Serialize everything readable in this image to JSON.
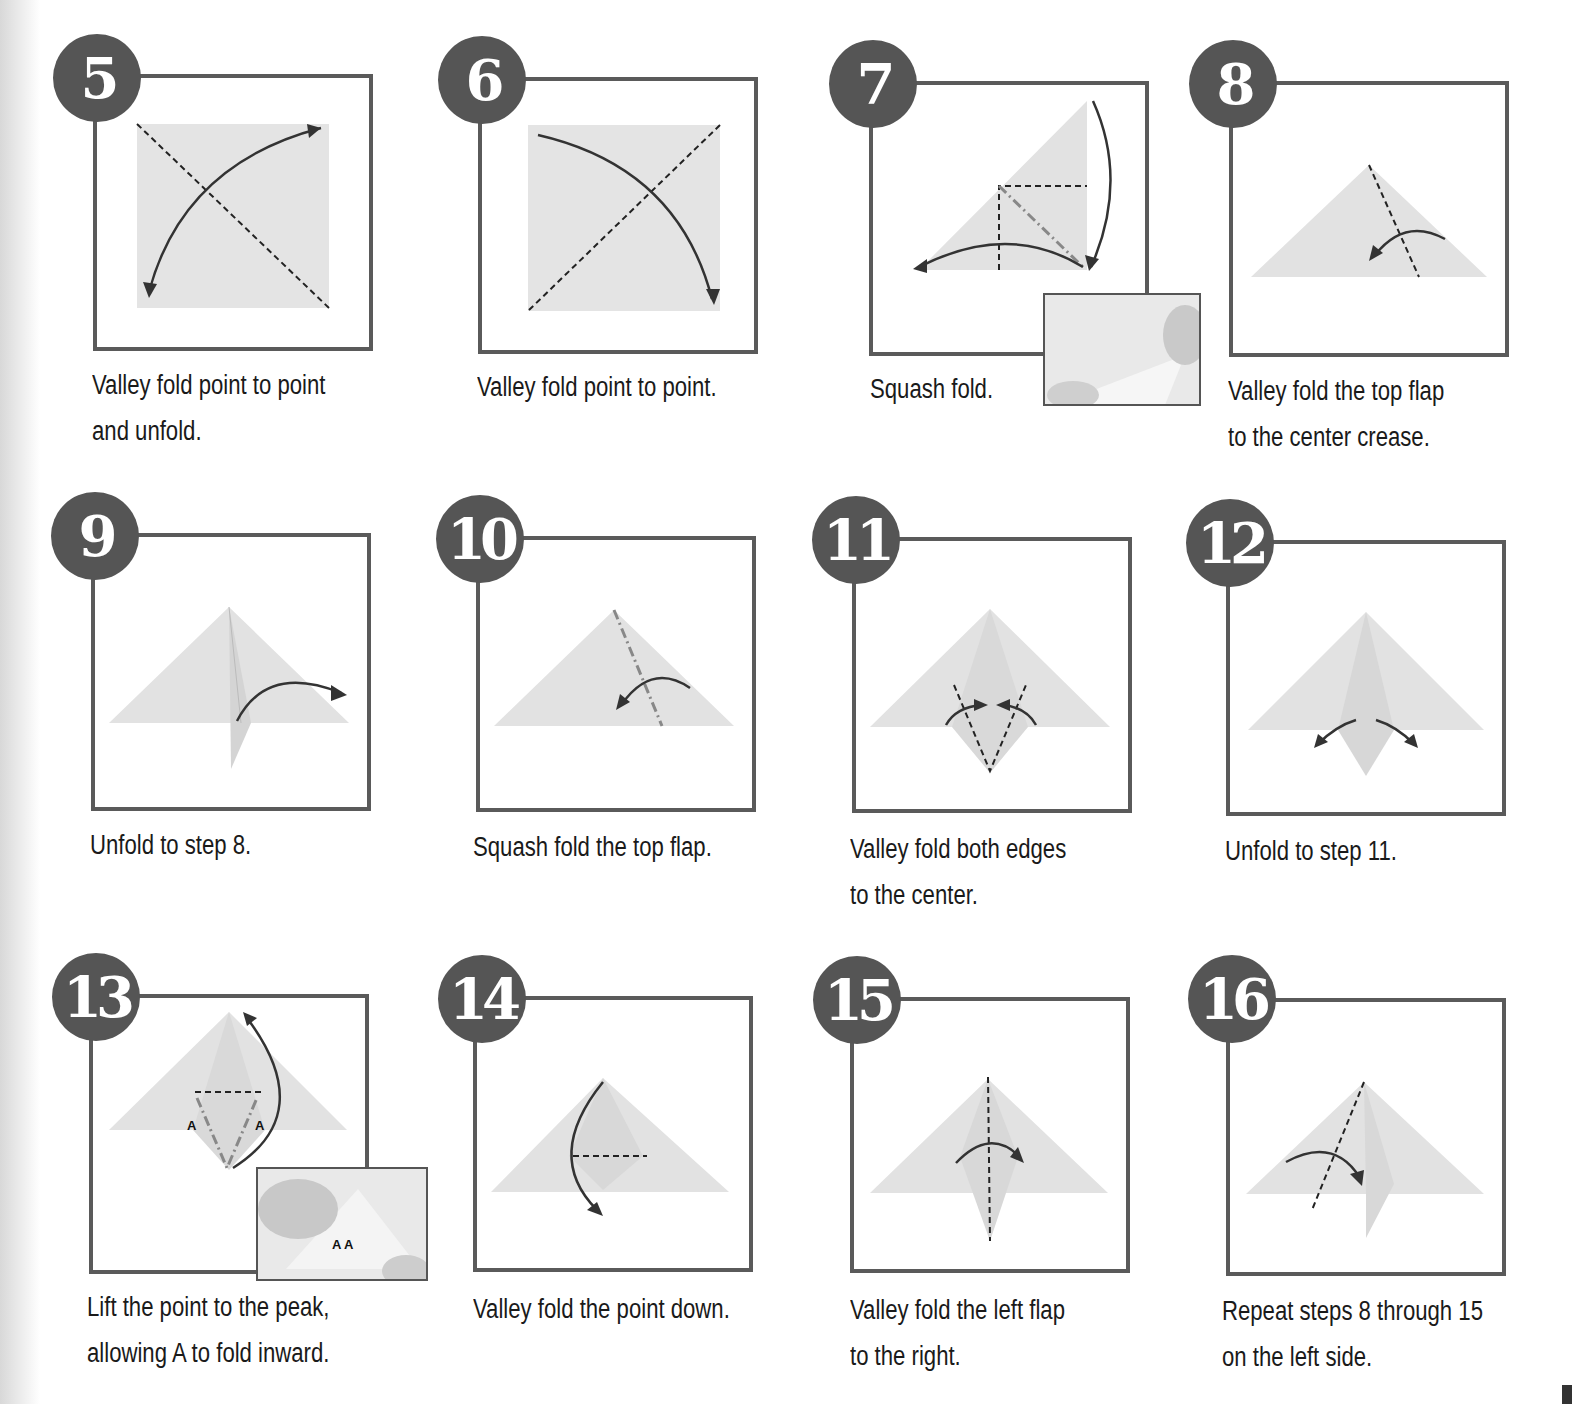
{
  "steps": [
    {
      "number": "5",
      "caption_line1": "Valley fold point to point",
      "caption_line2": "and unfold."
    },
    {
      "number": "6",
      "caption_line1": "Valley fold point to point.",
      "caption_line2": ""
    },
    {
      "number": "7",
      "caption_line1": "Squash fold.",
      "caption_line2": ""
    },
    {
      "number": "8",
      "caption_line1": "Valley fold the top flap",
      "caption_line2": "to the center crease."
    },
    {
      "number": "9",
      "caption_line1": "Unfold to step 8.",
      "caption_line2": ""
    },
    {
      "number": "10",
      "caption_line1": "Squash fold the top flap.",
      "caption_line2": ""
    },
    {
      "number": "11",
      "caption_line1": "Valley fold both edges",
      "caption_line2": "to the center."
    },
    {
      "number": "12",
      "caption_line1": "Unfold to step 11.",
      "caption_line2": ""
    },
    {
      "number": "13",
      "caption_line1": "Lift the point to the peak,",
      "caption_line2": "allowing A to fold inward.",
      "labels": [
        "A",
        "A"
      ],
      "inset_labels": "A A"
    },
    {
      "number": "14",
      "caption_line1": "Valley fold the point down.",
      "caption_line2": ""
    },
    {
      "number": "15",
      "caption_line1": "Valley fold the left flap",
      "caption_line2": "to the right."
    },
    {
      "number": "16",
      "caption_line1": "Repeat steps 8 through 15",
      "caption_line2": "on the left side."
    }
  ],
  "colors": {
    "badge": "#555555",
    "frame": "#5a5a5a",
    "paper": "#e2e2e2",
    "line": "#333333"
  }
}
